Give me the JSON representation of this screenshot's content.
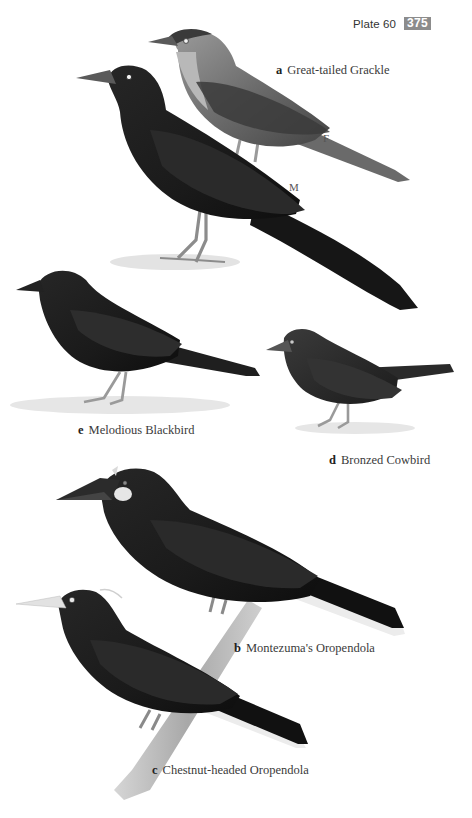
{
  "header": {
    "plate_label": "Plate 60",
    "page_number": "375",
    "page_number_bg": "#8c8c8c"
  },
  "species": [
    {
      "letter": "a",
      "name": "Great-tailed Grackle",
      "sex_labels": [
        "F",
        "M"
      ]
    },
    {
      "letter": "b",
      "name": "Montezuma's Oropendola"
    },
    {
      "letter": "c",
      "name": "Chestnut-headed Oropendola"
    },
    {
      "letter": "d",
      "name": "Bronzed Cowbird"
    },
    {
      "letter": "e",
      "name": "Melodious Blackbird"
    }
  ],
  "colors": {
    "plumage_black": "#1a1a1a",
    "plumage_dark": "#2b2b2b",
    "female_brown_grey": "#6e6e6e",
    "female_throat": "#b5b5b5",
    "legs": "#9a9a9a",
    "branch": "#b9b9b9",
    "tail_white": "#e8e8e8",
    "text": "#333333"
  }
}
